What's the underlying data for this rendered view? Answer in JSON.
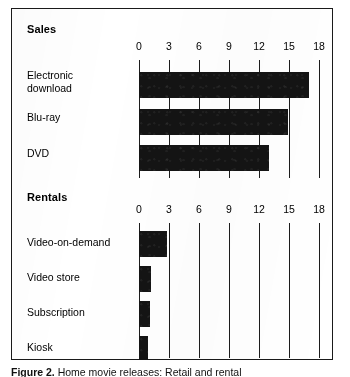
{
  "figure": {
    "caption_label": "Figure 2.",
    "caption_text": "Home movie releases: Retail and rental",
    "frame_color": "#1a1a1a",
    "bar_color": "#141414"
  },
  "chart_data": {
    "type": "bar",
    "orientation": "horizontal",
    "title": "",
    "grid": true,
    "legend": null,
    "panels": [
      {
        "title": "Sales",
        "xlabel": "",
        "ylabel": "",
        "xlim": [
          0,
          18
        ],
        "xticks": [
          0,
          3,
          6,
          9,
          12,
          15,
          18
        ],
        "xticklabels": [
          "0",
          "3",
          "6",
          "9",
          "12",
          "15",
          "18"
        ],
        "categories": [
          "Electronic\ndownload",
          "Blu-ray",
          "DVD"
        ],
        "values": [
          17.0,
          14.9,
          13.0
        ]
      },
      {
        "title": "Rentals",
        "xlabel": "",
        "ylabel": "",
        "xlim": [
          0,
          18
        ],
        "xticks": [
          0,
          3,
          6,
          9,
          12,
          15,
          18
        ],
        "xticklabels": [
          "0",
          "3",
          "6",
          "9",
          "12",
          "15",
          "18"
        ],
        "categories": [
          "Video-on-demand",
          "Video store",
          "Subscription",
          "Kiosk"
        ],
        "values": [
          2.8,
          1.2,
          1.1,
          0.9
        ]
      }
    ]
  }
}
